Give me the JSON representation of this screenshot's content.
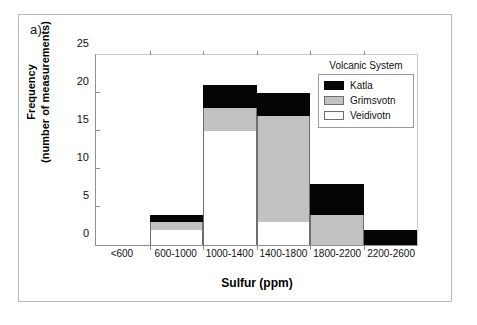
{
  "figure": {
    "panel_label": "a)"
  },
  "chart_data": {
    "type": "bar",
    "stacked": true,
    "title": "",
    "xlabel": "Sulfur (ppm)",
    "ylabel": "Frequency",
    "ylabel_line2": "(number of measurements)",
    "categories": [
      "<600",
      "600-1000",
      "1000-1400",
      "1400-1800",
      "1800-2200",
      "2200-2600"
    ],
    "ylim": [
      0,
      25
    ],
    "yticks": [
      0,
      5,
      10,
      15,
      20,
      25
    ],
    "grid": false,
    "legend_position": "top-right",
    "legend_title": "Volcanic System",
    "series": [
      {
        "name": "Veidivotn",
        "color": "#ffffff",
        "values": [
          0,
          2,
          15,
          3,
          0,
          0
        ]
      },
      {
        "name": "Grimsvotn",
        "color": "#c2c2c2",
        "values": [
          0,
          1,
          3,
          14,
          4,
          0
        ]
      },
      {
        "name": "Katla",
        "color": "#050505",
        "values": [
          0,
          1,
          3,
          3,
          4,
          2
        ]
      }
    ],
    "stack_totals": [
      0,
      4,
      21,
      20,
      8,
      2
    ]
  }
}
